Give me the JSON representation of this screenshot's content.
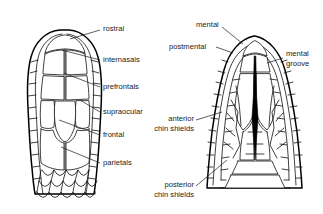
{
  "figure": {
    "background_color": "#ffffff",
    "ink_color": "#101010",
    "views": [
      {
        "id": "dorsal",
        "name": "dorsal view of head"
      },
      {
        "id": "ventral",
        "name": "ventral chin view of head"
      }
    ]
  },
  "labels": {
    "rostral": "rostral",
    "internasals": "internasals",
    "prefrontals": "prefrontals",
    "supraocular": "supraocular",
    "frontal": "frontal",
    "parietals": "parietals",
    "mental": "mental",
    "postmental": "postmental",
    "mental_groove_line1": "mental",
    "mental_groove_line2": "groove",
    "anterior_chin_line1": "anterior",
    "anterior_chin_line2": "chin shields",
    "posterior_chin_line1": "posterior",
    "posterior_chin_line2": "chin shields"
  },
  "annotations": [
    {
      "id": "rostral",
      "label": "rostral",
      "view": "dorsal",
      "text_x": 103,
      "text_y": 29,
      "anchor": "start",
      "leader": "M 100 30 L 70 39"
    },
    {
      "id": "internasals",
      "label": "internasals",
      "view": "dorsal",
      "text_x": 103,
      "text_y": 60,
      "anchor": "start",
      "leader": "M 100 60 L 62 50"
    },
    {
      "id": "prefrontals",
      "label": "prefrontals",
      "view": "dorsal",
      "text_x": 103,
      "text_y": 87,
      "anchor": "start",
      "leader": "M 100 87 L 64 73"
    },
    {
      "id": "supraocular",
      "label": "supraocular",
      "view": "dorsal",
      "text_x": 103,
      "text_y": 112,
      "anchor": "start",
      "leader": "M 100 112 L 80 100"
    },
    {
      "id": "frontal",
      "label": "frontal",
      "view": "dorsal",
      "text_x": 103,
      "text_y": 135,
      "anchor": "start",
      "leader": "M 100 135 L 59 120"
    },
    {
      "id": "parietals",
      "label": "parietals",
      "view": "dorsal",
      "text_x": 103,
      "text_y": 163,
      "anchor": "start",
      "leader": "M 100 163 L 61 147"
    },
    {
      "id": "mental",
      "label": "mental",
      "view": "ventral",
      "text_x": 196,
      "text_y": 25,
      "anchor": "start",
      "leader": "M 222 27 L 243 44"
    },
    {
      "id": "postmental",
      "label": "postmental",
      "view": "ventral",
      "text_x": 169,
      "text_y": 47,
      "anchor": "start",
      "leader": "M 216 47 L 233 53"
    },
    {
      "id": "mental-groove",
      "label": "mental groove",
      "view": "ventral",
      "text_x": 285,
      "text_y": 54,
      "anchor": "start",
      "leader": "M 283 58 L 267 63"
    },
    {
      "id": "anterior-chin-shields",
      "label": "anterior chin shields",
      "view": "ventral",
      "text_x": 194,
      "text_y": 124,
      "anchor": "end",
      "leader": "M 196 120 L 222 112"
    },
    {
      "id": "posterior-chin-shields",
      "label": "posterior chin shields",
      "view": "ventral",
      "text_x": 194,
      "text_y": 190,
      "anchor": "end",
      "leader": "M 196 186 L 227 160"
    }
  ]
}
